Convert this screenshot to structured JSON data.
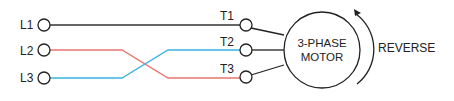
{
  "diagram": {
    "lines": [
      {
        "label": "L1",
        "terminal": "T1"
      },
      {
        "label": "L2",
        "terminal": "T3"
      },
      {
        "label": "L3",
        "terminal": "T2"
      }
    ],
    "labels": {
      "l1": "L1",
      "l2": "L2",
      "l3": "L3",
      "t1": "T1",
      "t2": "T2",
      "t3": "T3",
      "motor_line1": "3-PHASE",
      "motor_line2": "MOTOR",
      "direction": "REVERSE"
    },
    "colors": {
      "l1_wire": "#333333",
      "l2_wire": "#e8766f",
      "l3_wire": "#3ab4e0",
      "outline": "#222222"
    }
  }
}
